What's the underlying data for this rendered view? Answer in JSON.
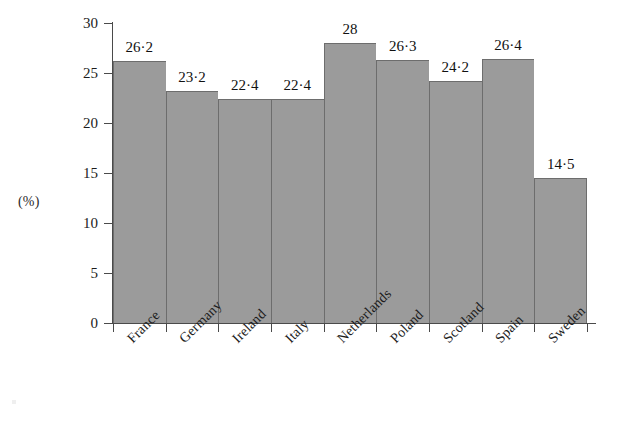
{
  "chart_data": {
    "type": "bar",
    "title": "",
    "xlabel": "",
    "ylabel": "(%)",
    "ylim": [
      0,
      30
    ],
    "yticks": [
      0,
      5,
      10,
      15,
      20,
      25,
      30
    ],
    "ytick_labels": [
      "0",
      "5",
      "10",
      "15",
      "20",
      "25",
      "30"
    ],
    "grid": false,
    "legend": null,
    "decimal_separator": "·",
    "bar_color": "#9b9b9b",
    "bar_edge_color": "#6d6d6d",
    "categories": [
      "France",
      "Germany",
      "Ireland",
      "Italy",
      "Netherlands",
      "Poland",
      "Scotland",
      "Spain",
      "Sweden"
    ],
    "values": [
      26.2,
      23.2,
      22.4,
      22.4,
      28,
      26.3,
      24.2,
      26.4,
      14.5
    ],
    "value_labels": [
      "26·2",
      "23·2",
      "22·4",
      "22·4",
      "28",
      "26·3",
      "24·2",
      "26·4",
      "14·5"
    ]
  },
  "axis": {
    "unit_label": "(%)"
  }
}
